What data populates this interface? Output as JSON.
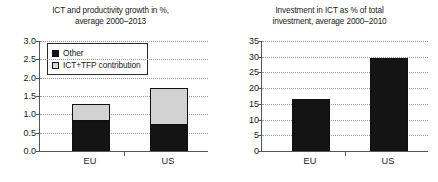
{
  "figure": {
    "panels": [
      {
        "id": "ict-productivity-growth",
        "title_line1": "ICT and productivity growth in %,",
        "title_line2": "average 2000–2013"
      },
      {
        "id": "investment-in-ict",
        "title_line1": "Investment in ICT as % of total",
        "title_line2": "investment, average 2000–2010"
      }
    ]
  },
  "legend": {
    "items": [
      {
        "label": "Other",
        "color": "#141414"
      },
      {
        "label": "ICT+TFP contribution",
        "color": "#d8d8d8"
      }
    ]
  },
  "colors": {
    "other": "#141414",
    "ict_tfp": "#d2d2d2",
    "axis": "#555555",
    "grid": "#9a9a9a",
    "text": "#1a1a1a",
    "background": "#ffffff"
  },
  "chart_data": [
    {
      "type": "bar",
      "id": "ict-productivity-growth",
      "title": "ICT and productivity growth in %, average 2000–2013",
      "xlabel": "",
      "ylabel": "",
      "ylim": [
        0.0,
        3.0
      ],
      "yticks": [
        "0.0",
        "0.5",
        "1.0",
        "1.5",
        "2.0",
        "2.5",
        "3.0"
      ],
      "ytick_values": [
        0.0,
        0.5,
        1.0,
        1.5,
        2.0,
        2.5,
        3.0
      ],
      "categories": [
        "EU",
        "US"
      ],
      "stacked": true,
      "grid": true,
      "legend_position": "upper left",
      "series": [
        {
          "name": "Other",
          "values": [
            0.83,
            0.7
          ],
          "color": "#141414"
        },
        {
          "name": "ICT+TFP contribution",
          "values": [
            0.44,
            1.01
          ],
          "color": "#d2d2d2"
        }
      ],
      "totals": [
        1.27,
        1.71
      ]
    },
    {
      "type": "bar",
      "id": "investment-in-ict",
      "title": "Investment in ICT as % of total investment, average 2000–2010",
      "xlabel": "",
      "ylabel": "",
      "ylim": [
        0,
        35
      ],
      "yticks": [
        "0",
        "5",
        "10",
        "15",
        "20",
        "25",
        "30",
        "35"
      ],
      "ytick_values": [
        0,
        5,
        10,
        15,
        20,
        25,
        30,
        35
      ],
      "categories": [
        "EU",
        "US"
      ],
      "stacked": false,
      "grid": true,
      "legend_position": "none",
      "series": [
        {
          "name": "Investment in ICT",
          "values": [
            16.7,
            29.6
          ],
          "color": "#141414"
        }
      ]
    }
  ]
}
